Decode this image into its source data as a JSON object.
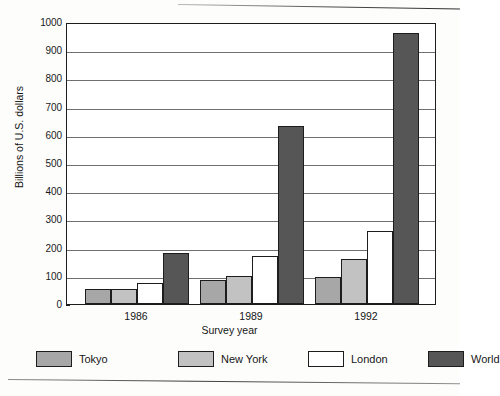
{
  "chart_data": {
    "type": "bar",
    "title": "",
    "xlabel": "Survey year",
    "ylabel": "Billions of U.S. dollars",
    "categories": [
      "1986",
      "1989",
      "1992"
    ],
    "ylim": [
      0,
      1000
    ],
    "ytick_step": 100,
    "yticks": [
      "0",
      "100",
      "200",
      "300",
      "400",
      "500",
      "600",
      "700",
      "800",
      "900",
      "1000"
    ],
    "grid": true,
    "legend_position": "bottom",
    "series": [
      {
        "name": "Tokyo",
        "color": "#a7a7a7",
        "values": [
          55,
          85,
          95
        ]
      },
      {
        "name": "New York",
        "color": "#c2c2c2",
        "values": [
          52,
          98,
          158
        ]
      },
      {
        "name": "London",
        "color": "#ffffff",
        "values": [
          75,
          172,
          260
        ]
      },
      {
        "name": "World",
        "color": "#565656",
        "values": [
          180,
          630,
          960
        ]
      }
    ]
  },
  "figure": {
    "axis_color": "#1d1d1d",
    "gridline_color": "#707070",
    "background": "#ffffff"
  }
}
